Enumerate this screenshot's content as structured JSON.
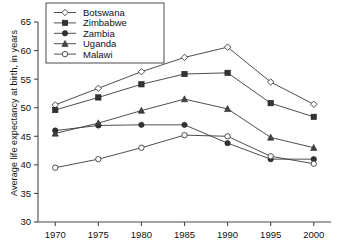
{
  "chart_data": {
    "type": "line",
    "title": "",
    "xlabel": "",
    "ylabel": "Average life expectancy at birth, in years",
    "x": [
      1970,
      1975,
      1980,
      1985,
      1990,
      1995,
      2000
    ],
    "xticklabels": [
      "1970",
      "1975",
      "1980",
      "1985",
      "1990",
      "1995",
      "2000"
    ],
    "yticklabels": [
      "30",
      "35",
      "40",
      "45",
      "50",
      "55",
      "60",
      "65"
    ],
    "yticks": [
      30,
      35,
      40,
      45,
      50,
      55,
      60,
      65
    ],
    "xlim": [
      1968,
      2002
    ],
    "ylim": [
      30,
      65
    ],
    "grid": false,
    "legend_position": "top-left-inside",
    "series": [
      {
        "name": "Botswana",
        "marker": "open-diamond",
        "color": "#3a3a3a",
        "values": [
          50.5,
          53.4,
          56.3,
          58.8,
          60.6,
          54.5,
          50.6
        ]
      },
      {
        "name": "Zimbabwe",
        "marker": "filled-square",
        "color": "#3a3a3a",
        "values": [
          49.6,
          51.8,
          54.1,
          55.9,
          56.1,
          50.8,
          48.4
        ]
      },
      {
        "name": "Zambia",
        "marker": "filled-circle",
        "color": "#3a3a3a",
        "values": [
          46.0,
          46.9,
          47.0,
          47.0,
          43.8,
          41.0,
          41.0
        ]
      },
      {
        "name": "Uganda",
        "marker": "filled-triangle",
        "color": "#3a3a3a",
        "values": [
          45.5,
          47.3,
          49.5,
          51.5,
          49.8,
          44.8,
          43.0
        ]
      },
      {
        "name": "Malawi",
        "marker": "open-circle",
        "color": "#3a3a3a",
        "values": [
          39.5,
          41.0,
          43.0,
          45.2,
          45.0,
          41.5,
          40.2
        ]
      }
    ]
  }
}
